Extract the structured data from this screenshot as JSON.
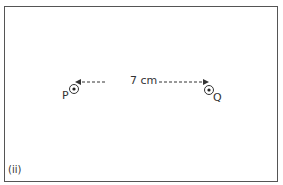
{
  "figure": {
    "panel_label": "(ii)",
    "points": [
      {
        "name": "P",
        "symbol": "current-out-of-page"
      },
      {
        "name": "Q",
        "symbol": "current-out-of-page"
      }
    ],
    "distance_label": "7 cm"
  }
}
